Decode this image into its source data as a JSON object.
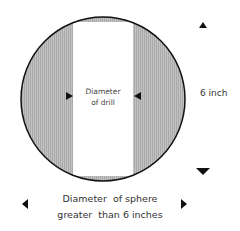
{
  "diagram": {
    "drill_label_line1": "Diameter",
    "drill_label_line2": "of drill",
    "height_label": "6 inch",
    "sphere_label_line1": "Diameter  of sphere",
    "sphere_label_line2": "greater  than 6 inches",
    "colors": {
      "sphere_fill": "#b8b8b8",
      "sphere_outline": "#111111",
      "drill_band": "#ffffff",
      "arrow": "#111111"
    }
  }
}
